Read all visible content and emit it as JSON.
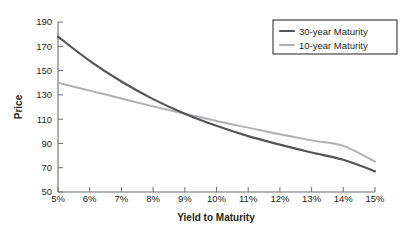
{
  "chart_data": {
    "type": "line",
    "title": "",
    "xlabel": "Yield to Maturity",
    "ylabel": "Price",
    "xlim": [
      5,
      15
    ],
    "ylim": [
      50,
      190
    ],
    "grid": false,
    "legend_position": "top-right",
    "x": [
      5,
      6,
      7,
      8,
      9,
      10,
      11,
      12,
      13,
      14,
      15
    ],
    "xtick_labels": [
      "5%",
      "6%",
      "7%",
      "8%",
      "9%",
      "10%",
      "11%",
      "12%",
      "13%",
      "14%",
      "15%"
    ],
    "ytick_labels": [
      "50",
      "70",
      "90",
      "110",
      "130",
      "150",
      "170",
      "190"
    ],
    "ytick_values": [
      50,
      70,
      90,
      110,
      130,
      150,
      170,
      190
    ],
    "series": [
      {
        "name": "30-year Maturity",
        "color": "#555559",
        "width": 2.2,
        "values": [
          178.0,
          158.0,
          141.0,
          126.5,
          114.5,
          104.5,
          96.0,
          89.0,
          82.5,
          76.5,
          67.0
        ]
      },
      {
        "name": "10-year Maturity",
        "color": "#b0b0b2",
        "width": 2.0,
        "values": [
          140.0,
          133.5,
          127.0,
          120.5,
          114.5,
          108.5,
          103.0,
          97.5,
          92.5,
          88.0,
          75.0
        ]
      }
    ]
  },
  "legend": {
    "items": [
      {
        "label": "30-year Maturity",
        "color": "#555559"
      },
      {
        "label": "10-year Maturity",
        "color": "#b0b0b2"
      }
    ],
    "border_color": "#231f20"
  },
  "axes": {
    "x_title": "Yield to Maturity",
    "y_title": "Price",
    "axis_color": "#6d6e71"
  }
}
